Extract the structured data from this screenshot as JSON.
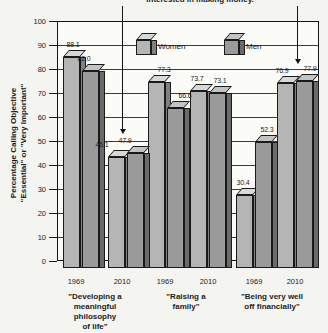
{
  "caption": {
    "text": "interested in making money."
  },
  "legend": {
    "items": [
      {
        "label": "Women"
      },
      {
        "label": "Men"
      }
    ]
  },
  "y_axis": {
    "title_lines": [
      "Percentage Calling Objective",
      "\"Essential\" or \"Very Important\""
    ],
    "ticks": [
      100,
      90,
      80,
      70,
      60,
      50,
      40,
      30,
      20,
      10,
      0
    ]
  },
  "chart_data": {
    "type": "bar",
    "title": "",
    "xlabel": "",
    "ylabel": "Percentage Calling Objective \"Essential\" or \"Very Important\"",
    "ylim": [
      0,
      100
    ],
    "grid": true,
    "legend_position": "top-inside",
    "series_names": [
      "Women",
      "Men"
    ],
    "groups": [
      {
        "label": "\"Developing a meaningful philosophy of life\"",
        "label_lines": [
          "\"Developing a",
          "meaningful",
          "philosophy",
          "of life\""
        ],
        "years": [
          {
            "year": "1969",
            "women": 88.1,
            "men": 82.0
          },
          {
            "year": "2010",
            "women": 46.1,
            "men": 47.9
          }
        ]
      },
      {
        "label": "\"Raising a family\"",
        "label_lines": [
          "\"Raising a",
          "family\""
        ],
        "years": [
          {
            "year": "1969",
            "women": 77.3,
            "men": 66.6
          },
          {
            "year": "2010",
            "women": 73.7,
            "men": 73.1
          }
        ]
      },
      {
        "label": "\"Being very well off financially\"",
        "label_lines": [
          "\"Being very well",
          "off financially\""
        ],
        "years": [
          {
            "year": "1969",
            "women": 30.4,
            "men": 52.3
          },
          {
            "year": "2010",
            "women": 76.9,
            "men": 77.9
          }
        ]
      }
    ]
  },
  "colors": {
    "women": {
      "front": "#b5b5b5",
      "top": "#d8d8d8",
      "side": "#808080"
    },
    "men": {
      "front": "#9a9a9a",
      "top": "#c3c3c3",
      "side": "#6a6a6a"
    },
    "outline": "#1a1a1a",
    "grid": "#3c3c3c",
    "background": "#f4f4f1",
    "plot_background": "#fbfbf8",
    "text": "#1c1c1c"
  }
}
